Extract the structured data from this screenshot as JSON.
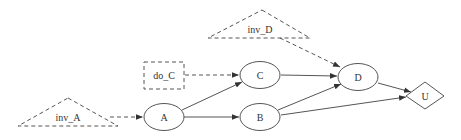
{
  "diagram": {
    "type": "influence-diagram",
    "colors": {
      "stroke": "#555555",
      "text": "#333333",
      "background": "#ffffff"
    },
    "nodes": [
      {
        "id": "inv_A",
        "label": "inv_A",
        "shape": "triangle",
        "style": "dashed"
      },
      {
        "id": "do_C",
        "label": "do_C",
        "shape": "rectangle",
        "style": "dashed"
      },
      {
        "id": "inv_D",
        "label": "inv_D",
        "shape": "triangle",
        "style": "dashed"
      },
      {
        "id": "A",
        "label": "A",
        "shape": "ellipse",
        "style": "solid"
      },
      {
        "id": "B",
        "label": "B",
        "shape": "ellipse",
        "style": "solid"
      },
      {
        "id": "C",
        "label": "C",
        "shape": "ellipse",
        "style": "solid"
      },
      {
        "id": "D",
        "label": "D",
        "shape": "ellipse",
        "style": "solid"
      },
      {
        "id": "U",
        "label": "U",
        "shape": "diamond",
        "style": "solid"
      }
    ],
    "edges": [
      {
        "from": "inv_A",
        "to": "A",
        "style": "dashed"
      },
      {
        "from": "do_C",
        "to": "C",
        "style": "dashed"
      },
      {
        "from": "inv_D",
        "to": "D",
        "style": "dashed"
      },
      {
        "from": "A",
        "to": "C",
        "style": "solid"
      },
      {
        "from": "A",
        "to": "B",
        "style": "solid"
      },
      {
        "from": "C",
        "to": "D",
        "style": "solid"
      },
      {
        "from": "B",
        "to": "D",
        "style": "solid"
      },
      {
        "from": "B",
        "to": "U",
        "style": "solid"
      },
      {
        "from": "D",
        "to": "U",
        "style": "solid"
      }
    ]
  },
  "labels": {
    "inv_A": "inv_A",
    "do_C": "do_C",
    "inv_D": "inv_D",
    "A": "A",
    "B": "B",
    "C": "C",
    "D": "D",
    "U": "U"
  }
}
